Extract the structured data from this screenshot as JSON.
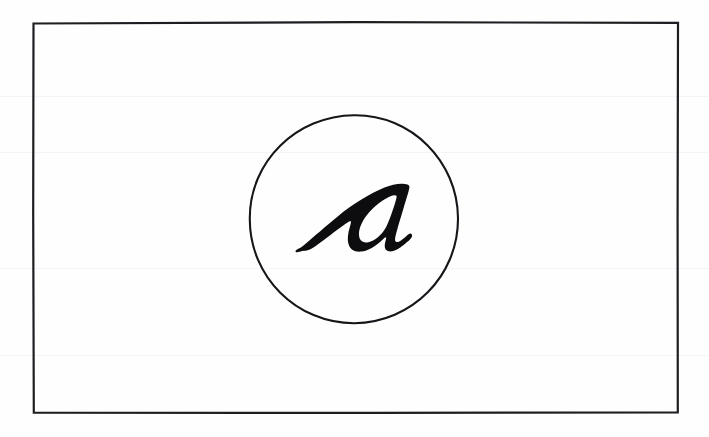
{
  "document": {
    "kind": "scanned-handwritten-figure",
    "background_color": "#fefefe",
    "ink_color": "#0d0d10",
    "caption": ""
  },
  "frame": {
    "name": "rectangular-border",
    "shape": "rectangle",
    "stroke_color": "#1e1e22",
    "stroke_width": 2.2,
    "x": 33,
    "y": 23,
    "width": 645,
    "height": 390
  },
  "circle": {
    "name": "hand-drawn-circle",
    "shape": "circle",
    "stroke_color": "#16161a",
    "stroke_width": 2.1,
    "center_x": 354,
    "center_y": 219,
    "radius": 104
  },
  "glyph": {
    "name": "letter-a",
    "character": "a",
    "style": "cursive-italic-bold",
    "fill_color": "#0d0d10",
    "center_x": 354,
    "center_y": 219,
    "bbox": {
      "x": 300,
      "y": 183,
      "width": 112,
      "height": 68
    }
  },
  "artifacts": {
    "scan_bands": [
      96,
      152,
      268,
      355
    ],
    "band_color": "#f4f4f6"
  }
}
